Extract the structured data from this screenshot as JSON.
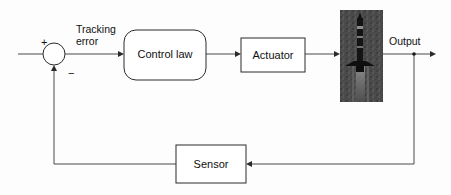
{
  "diagram": {
    "background_color": "#fdfdfd",
    "line_color": "#4a4a4a",
    "text_color": "#101010",
    "blocks": [
      {
        "id": "control-law",
        "label": "Control law",
        "shape": "rounded-rectangle",
        "x": 124,
        "y": 30,
        "width": 82,
        "height": 50
      },
      {
        "id": "actuator",
        "label": "Actuator",
        "shape": "rectangle",
        "x": 241,
        "y": 38,
        "width": 64,
        "height": 34
      },
      {
        "id": "sensor",
        "label": "Sensor",
        "shape": "rectangle",
        "x": 176,
        "y": 145,
        "width": 70,
        "height": 38
      }
    ],
    "plant_image": {
      "id": "plant-photo",
      "description": "rocket",
      "x": 340,
      "y": 10,
      "width": 43,
      "height": 92,
      "background_color": "#4b4b4b",
      "body_color": "#141414"
    },
    "summing_junction": {
      "id": "summing-junction",
      "center_x": 54,
      "center_y": 54,
      "radius": 11,
      "plus_sign": "+",
      "minus_sign": "−"
    },
    "labels": {
      "tracking_error_line1": "Tracking",
      "tracking_error_line2": "error",
      "output": "Output"
    }
  }
}
